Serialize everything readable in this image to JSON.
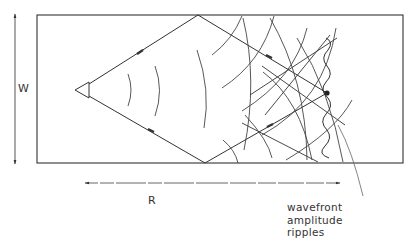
{
  "diagram": {
    "labels": {
      "width": "W",
      "range": "R"
    },
    "callout": {
      "lines": [
        "wavefront",
        "amplitude",
        "ripples"
      ]
    },
    "elements": {
      "channel": "rectangular channel of width W",
      "source": "triangular source",
      "direct_rays": "rays reflecting off top and bottom walls",
      "receiver": "receiver point",
      "wavefronts": "circular wavefront arcs",
      "ripple": "wavy amplitude ripple curve"
    },
    "colors": {
      "stroke": "#333333",
      "background": "#ffffff"
    }
  }
}
